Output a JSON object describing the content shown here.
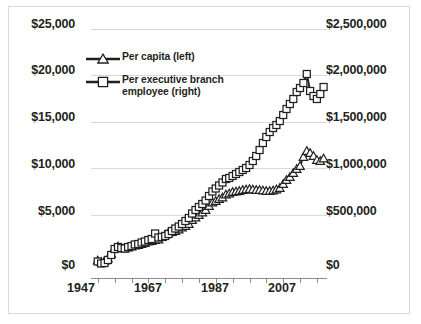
{
  "chart_data": {
    "type": "line",
    "title": "",
    "xlabel": "",
    "ylabel": "",
    "grid": true,
    "legend_position": "inside-top-left",
    "x": [
      1947,
      1948,
      1949,
      1950,
      1951,
      1952,
      1953,
      1954,
      1955,
      1956,
      1957,
      1958,
      1959,
      1960,
      1961,
      1962,
      1963,
      1964,
      1965,
      1966,
      1967,
      1968,
      1969,
      1970,
      1971,
      1972,
      1973,
      1974,
      1975,
      1976,
      1977,
      1978,
      1979,
      1980,
      1981,
      1982,
      1983,
      1984,
      1985,
      1986,
      1987,
      1988,
      1989,
      1990,
      1991,
      1992,
      1993,
      1994,
      1995,
      1996,
      1997,
      1998,
      1999,
      2000,
      2001,
      2002,
      2003,
      2004,
      2005,
      2006,
      2007,
      2008,
      2009,
      2010,
      2011,
      2012,
      2013,
      2014
    ],
    "xlim": [
      1945,
      2015
    ],
    "xticks_major": [
      1947,
      1967,
      1987,
      2007
    ],
    "xtick_interval_minor": 5,
    "left_axis": {
      "ticks": [
        "$0",
        "$5,000",
        "$10,000",
        "$15,000",
        "$20,000",
        "$25,000"
      ],
      "values": [
        0,
        5000,
        10000,
        15000,
        20000,
        25000
      ],
      "ylim": [
        0,
        25000
      ]
    },
    "right_axis": {
      "ticks": [
        "$0",
        "$500,000",
        "$1,000,000",
        "$1,500,000",
        "$2,000,000",
        "$2,500,000"
      ],
      "values": [
        0,
        500000,
        1000000,
        1500000,
        2000000,
        2500000
      ],
      "ylim": [
        0,
        2500000
      ]
    },
    "series": [
      {
        "name": "Per capita (left)",
        "axis": "left",
        "marker": "triangle",
        "values": [
          1850,
          1700,
          1800,
          2050,
          2500,
          3050,
          3250,
          3100,
          3050,
          3150,
          3250,
          3350,
          3400,
          3500,
          3600,
          3750,
          3800,
          3900,
          3950,
          4200,
          4450,
          4650,
          4700,
          4800,
          4950,
          5150,
          5300,
          5500,
          5900,
          6150,
          6400,
          6650,
          6900,
          7300,
          7650,
          7800,
          8000,
          8150,
          8450,
          8550,
          8700,
          8750,
          8800,
          8900,
          8950,
          9000,
          8950,
          8900,
          8900,
          8850,
          8800,
          8800,
          8850,
          8950,
          9100,
          9500,
          9900,
          10200,
          10600,
          11000,
          11300,
          12200,
          12800,
          12600,
          12300,
          11900,
          11800,
          12050
        ]
      },
      {
        "name": "Per executive branch employee (right)",
        "axis": "right",
        "marker": "square",
        "values": [
          175000,
          155000,
          160000,
          190000,
          240000,
          300000,
          320000,
          310000,
          305000,
          320000,
          330000,
          345000,
          350000,
          365000,
          375000,
          390000,
          400000,
          455000,
          415000,
          420000,
          430000,
          450000,
          480000,
          505000,
          525000,
          550000,
          580000,
          610000,
          655000,
          690000,
          720000,
          750000,
          785000,
          830000,
          875000,
          905000,
          935000,
          965000,
          1000000,
          1010000,
          1030000,
          1050000,
          1070000,
          1090000,
          1110000,
          1140000,
          1180000,
          1230000,
          1290000,
          1360000,
          1420000,
          1470000,
          1510000,
          1540000,
          1580000,
          1640000,
          1700000,
          1750000,
          1800000,
          1870000,
          1910000,
          1960000,
          2050000,
          1880000,
          1830000,
          1800000,
          1850000,
          1920000
        ]
      }
    ]
  },
  "legend": {
    "items": [
      {
        "label": "Per capita (left)",
        "marker": "triangle"
      },
      {
        "label": "Per executive branch employee (right)",
        "marker": "square"
      }
    ]
  }
}
